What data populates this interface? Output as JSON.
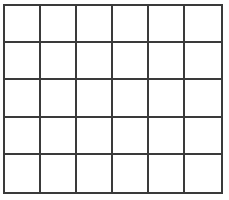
{
  "diagram": {
    "type": "empty-grid",
    "rows": 5,
    "columns": 6,
    "line_color": "#3a3a3a",
    "background_color": "#ffffff",
    "cells": [
      [
        "",
        "",
        "",
        "",
        "",
        ""
      ],
      [
        "",
        "",
        "",
        "",
        "",
        ""
      ],
      [
        "",
        "",
        "",
        "",
        "",
        ""
      ],
      [
        "",
        "",
        "",
        "",
        "",
        ""
      ],
      [
        "",
        "",
        "",
        "",
        "",
        ""
      ]
    ]
  }
}
